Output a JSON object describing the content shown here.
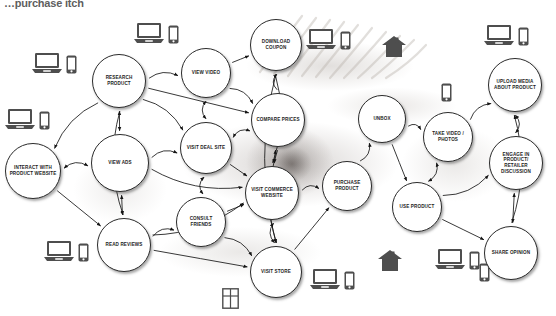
{
  "title": "…purchase itch",
  "colors": {
    "node_fill": "#ffffff",
    "node_stroke": "#2b2b2b",
    "edge_stroke": "#1a1a1a",
    "icon_fill": "#4a4a4a",
    "text": "#1d1d1d",
    "background": "#ffffff"
  },
  "diagram": {
    "type": "directed-graph",
    "name": "consumer-purchase-journey-touchpoint-map",
    "nodes": [
      {
        "id": "research-product",
        "label": "RESEARCH PRODUCT",
        "cx": 119,
        "cy": 81,
        "r": 27
      },
      {
        "id": "view-video",
        "label": "VIEW VIDEO",
        "cx": 206,
        "cy": 73,
        "r": 25
      },
      {
        "id": "download-coupon",
        "label": "DOWNLOAD COUPON",
        "cx": 276,
        "cy": 45,
        "r": 26
      },
      {
        "id": "compare-prices",
        "label": "COMPARE PRICES",
        "cx": 278,
        "cy": 120,
        "r": 27
      },
      {
        "id": "interact-with-product-website",
        "label": "INTERACT WITH PRODUCT WEBSITE",
        "cx": 33,
        "cy": 171,
        "r": 28
      },
      {
        "id": "view-ads",
        "label": "VIEW ADS",
        "cx": 120,
        "cy": 163,
        "r": 29
      },
      {
        "id": "visit-deal-site",
        "label": "VISIT DEAL SITE",
        "cx": 206,
        "cy": 148,
        "r": 26
      },
      {
        "id": "visit-commerce-website",
        "label": "VISIT COMMERCE WEBSITE",
        "cx": 272,
        "cy": 193,
        "r": 27
      },
      {
        "id": "consult-friends",
        "label": "CONSULT FRIENDS",
        "cx": 201,
        "cy": 222,
        "r": 25
      },
      {
        "id": "read-reviews",
        "label": "READ REVIEWS",
        "cx": 124,
        "cy": 245,
        "r": 27
      },
      {
        "id": "visit-store",
        "label": "VISIT STORE",
        "cx": 276,
        "cy": 272,
        "r": 26
      },
      {
        "id": "purchase-product",
        "label": "PURCHASE PRODUCT",
        "cx": 347,
        "cy": 186,
        "r": 25
      },
      {
        "id": "unbox",
        "label": "UNBOX",
        "cx": 382,
        "cy": 119,
        "r": 24
      },
      {
        "id": "take-video-photos",
        "label": "TAKE VIDEO / PHOTOS",
        "cx": 448,
        "cy": 137,
        "r": 25
      },
      {
        "id": "use-product",
        "label": "USE PRODUCT",
        "cx": 417,
        "cy": 207,
        "r": 25
      },
      {
        "id": "upload-media-about-product",
        "label": "UPLOAD MEDIA ABOUT PRODUCT",
        "cx": 515,
        "cy": 85,
        "r": 27
      },
      {
        "id": "engage-in-product-retailer-discussion",
        "label": "ENGAGE IN PRODUCT/ RETAILER DISCUSSION",
        "cx": 516,
        "cy": 163,
        "r": 27
      },
      {
        "id": "share-opinion",
        "label": "SHARE OPINION",
        "cx": 511,
        "cy": 253,
        "r": 27
      }
    ],
    "icons": [
      {
        "id": "laptop-phone-top-left-a",
        "type": "laptop-phone",
        "x": 32,
        "y": 52
      },
      {
        "id": "laptop-phone-top-center",
        "type": "laptop-phone",
        "x": 134,
        "y": 22
      },
      {
        "id": "laptop-phone-mid-left",
        "type": "laptop-phone",
        "x": 5,
        "y": 108
      },
      {
        "id": "laptop-phone-top-right-a",
        "type": "laptop-phone",
        "x": 306,
        "y": 28
      },
      {
        "id": "house-top-right",
        "type": "house",
        "x": 382,
        "y": 36
      },
      {
        "id": "phone-mid-right",
        "type": "phone",
        "x": 441,
        "y": 83
      },
      {
        "id": "laptop-phone-top-right-b",
        "type": "laptop-phone",
        "x": 484,
        "y": 24
      },
      {
        "id": "laptop-phone-bottom-left",
        "type": "laptop-phone",
        "x": 44,
        "y": 240
      },
      {
        "id": "window-grid-bottom",
        "type": "window",
        "x": 222,
        "y": 288
      },
      {
        "id": "laptop-phone-bottom-mid",
        "type": "laptop-phone",
        "x": 310,
        "y": 268
      },
      {
        "id": "house-bottom-right",
        "type": "house",
        "x": 378,
        "y": 250
      },
      {
        "id": "laptop-phone-bottom-right",
        "type": "laptop-phone",
        "x": 435,
        "y": 248
      },
      {
        "id": "phone-bottom-right",
        "type": "phone",
        "x": 479,
        "y": 263
      }
    ],
    "edges": [
      {
        "from": "research-product",
        "to": "view-video",
        "arrow": "single"
      },
      {
        "from": "research-product",
        "to": "view-ads",
        "arrow": "double"
      },
      {
        "from": "research-product",
        "to": "interact-with-product-website",
        "arrow": "single"
      },
      {
        "from": "research-product",
        "to": "visit-deal-site",
        "arrow": "single"
      },
      {
        "from": "research-product",
        "to": "compare-prices",
        "arrow": "single"
      },
      {
        "from": "research-product",
        "to": "read-reviews",
        "arrow": "single"
      },
      {
        "from": "view-video",
        "to": "compare-prices",
        "arrow": "single"
      },
      {
        "from": "view-video",
        "to": "download-coupon",
        "arrow": "single"
      },
      {
        "from": "view-video",
        "to": "visit-deal-site",
        "arrow": "double"
      },
      {
        "from": "view-ads",
        "to": "visit-deal-site",
        "arrow": "single"
      },
      {
        "from": "view-ads",
        "to": "read-reviews",
        "arrow": "double"
      },
      {
        "from": "view-ads",
        "to": "visit-commerce-website",
        "arrow": "single"
      },
      {
        "from": "visit-deal-site",
        "to": "compare-prices",
        "arrow": "double"
      },
      {
        "from": "visit-deal-site",
        "to": "visit-commerce-website",
        "arrow": "single"
      },
      {
        "from": "visit-deal-site",
        "to": "consult-friends",
        "arrow": "double"
      },
      {
        "from": "compare-prices",
        "to": "download-coupon",
        "arrow": "single"
      },
      {
        "from": "compare-prices",
        "to": "visit-commerce-website",
        "arrow": "double"
      },
      {
        "from": "compare-prices",
        "to": "visit-store",
        "arrow": "single"
      },
      {
        "from": "read-reviews",
        "to": "consult-friends",
        "arrow": "single"
      },
      {
        "from": "read-reviews",
        "to": "visit-store",
        "arrow": "single"
      },
      {
        "from": "read-reviews",
        "to": "visit-commerce-website",
        "arrow": "single"
      },
      {
        "from": "consult-friends",
        "to": "visit-store",
        "arrow": "single"
      },
      {
        "from": "consult-friends",
        "to": "visit-commerce-website",
        "arrow": "single"
      },
      {
        "from": "visit-commerce-website",
        "to": "visit-store",
        "arrow": "double"
      },
      {
        "from": "visit-commerce-website",
        "to": "purchase-product",
        "arrow": "single"
      },
      {
        "from": "visit-store",
        "to": "purchase-product",
        "arrow": "single"
      },
      {
        "from": "purchase-product",
        "to": "unbox",
        "arrow": "single"
      },
      {
        "from": "unbox",
        "to": "take-video-photos",
        "arrow": "single"
      },
      {
        "from": "unbox",
        "to": "use-product",
        "arrow": "single"
      },
      {
        "from": "use-product",
        "to": "take-video-photos",
        "arrow": "double"
      },
      {
        "from": "take-video-photos",
        "to": "upload-media-about-product",
        "arrow": "single"
      },
      {
        "from": "use-product",
        "to": "share-opinion",
        "arrow": "single"
      },
      {
        "from": "use-product",
        "to": "engage-in-product-retailer-discussion",
        "arrow": "single"
      },
      {
        "from": "upload-media-about-product",
        "to": "engage-in-product-retailer-discussion",
        "arrow": "double"
      },
      {
        "from": "engage-in-product-retailer-discussion",
        "to": "share-opinion",
        "arrow": "double"
      },
      {
        "from": "share-opinion",
        "to": "upload-media-about-product",
        "arrow": "single"
      },
      {
        "from": "interact-with-product-website",
        "to": "view-ads",
        "arrow": "double"
      },
      {
        "from": "interact-with-product-website",
        "to": "read-reviews",
        "arrow": "single"
      },
      {
        "from": "download-coupon",
        "to": "visit-store",
        "arrow": "single"
      },
      {
        "from": "download-coupon",
        "to": "visit-commerce-website",
        "arrow": "single"
      }
    ]
  }
}
